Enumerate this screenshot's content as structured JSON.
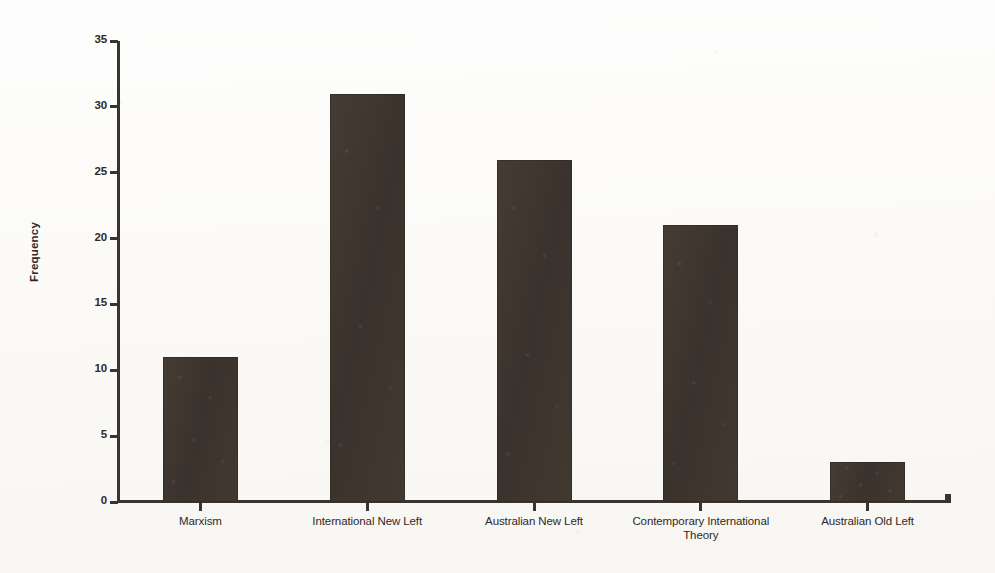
{
  "chart_data": {
    "type": "bar",
    "title": "",
    "xlabel": "",
    "ylabel": "Frequency",
    "categories": [
      "Marxism",
      "International New Left",
      "Australian New Left",
      "Contemporary International Theory",
      "Australian Old Left"
    ],
    "values": [
      11,
      31,
      26,
      21,
      3
    ],
    "ylim": [
      0,
      35
    ],
    "yticks": [
      0,
      5,
      10,
      15,
      20,
      25,
      30,
      35
    ],
    "ytick_labels": [
      "0",
      "5",
      "10",
      "15",
      "20",
      "25",
      "30",
      "35"
    ],
    "grid": false,
    "legend": false,
    "legend_position": "none",
    "bar_color": "#3e362f",
    "axis_color": "#3a332e",
    "background_color": "#fcfbf8"
  }
}
